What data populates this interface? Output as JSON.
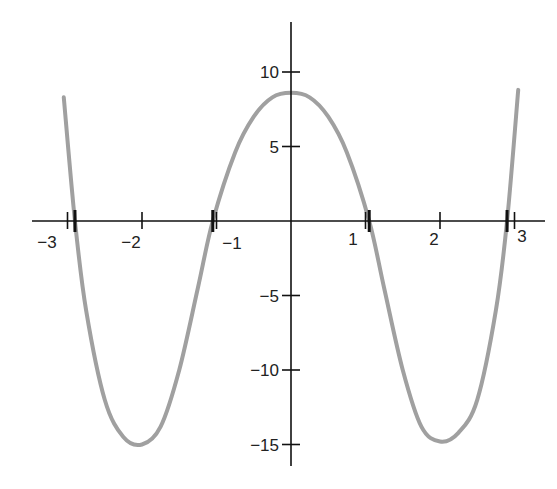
{
  "chart_data": {
    "type": "line",
    "title": "",
    "xlabel": "",
    "ylabel": "",
    "xlim": [
      -3.1,
      3.1
    ],
    "ylim": [
      -18,
      14
    ],
    "grid": false,
    "legend": null,
    "x_ticks": [
      -3,
      -2,
      -1,
      1,
      2,
      3
    ],
    "x_tick_labels": [
      "−3",
      "−2",
      "−1",
      "1",
      "2",
      "3"
    ],
    "y_ticks": [
      10,
      5,
      -5,
      -10,
      -15
    ],
    "y_tick_labels": [
      "10",
      "5",
      "−5",
      "−10",
      "−15"
    ],
    "zeros_marked": [
      -2.9,
      -1.05,
      1.05,
      2.9
    ],
    "series": [
      {
        "name": "f(x)",
        "color": "#a0a0a0",
        "x": [
          -3.05,
          -2.9,
          -2.75,
          -2.5,
          -2.25,
          -2.0,
          -1.75,
          -1.5,
          -1.25,
          -1.05,
          -0.75,
          -0.5,
          -0.25,
          0.0,
          0.25,
          0.5,
          0.75,
          1.05,
          1.25,
          1.5,
          1.75,
          2.0,
          2.25,
          2.5,
          2.75,
          2.9,
          3.05
        ],
        "y": [
          8.3,
          0.0,
          -6.0,
          -12.0,
          -14.5,
          -15.0,
          -13.8,
          -10.0,
          -4.5,
          0.0,
          4.6,
          7.0,
          8.3,
          8.6,
          8.3,
          7.0,
          4.6,
          0.0,
          -4.5,
          -10.0,
          -13.8,
          -14.8,
          -14.2,
          -12.0,
          -6.0,
          0.0,
          8.8
        ]
      }
    ]
  }
}
